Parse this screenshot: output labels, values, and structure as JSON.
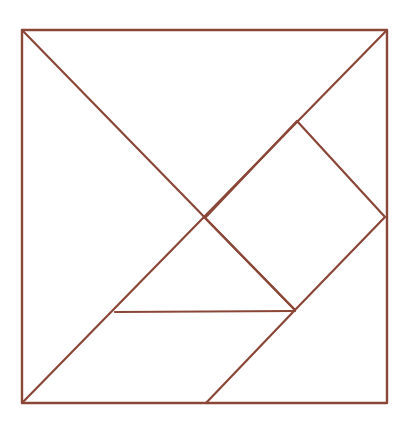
{
  "figure": {
    "title": "Tangram dissection of a square",
    "kind": "line-diagram",
    "canvas": {
      "width": 409,
      "height": 426
    },
    "background_color": "#ffffff",
    "stroke_color": "#8a4738",
    "stroke_width": 2.2,
    "outline_stroke_width": 2.4,
    "square": {
      "label": "outer square",
      "left": 22,
      "top": 30,
      "right": 387,
      "bottom": 403,
      "width": 365,
      "height": 373
    },
    "vertices": {
      "top_left": "22,30",
      "top_right": "387,30",
      "bottom_right": "387,403",
      "bottom_left": "22,403",
      "center_cross": "205,218",
      "diamond_top": "297,121",
      "diamond_right": "385,217",
      "diamond_bottom": "295,310",
      "left_mid_lower": "115,312",
      "bottom_mid": "206,403"
    },
    "paths": {
      "outline": "M22,30 L387,30 L387,403 L22,403 Z",
      "main_diagonal": "M22,30 L295,310",
      "anti_diagonal": "M387,30 L22,403",
      "diamond": "M297,121 L385,217 L295,310 L205,218 Z",
      "horizontal_chord": "M115,312 L295,311",
      "lower_right_cut": "M295,310 L206,403"
    },
    "pieces": [
      {
        "name": "large-triangle-upper-left",
        "points": "22,30 205,218 22,403"
      },
      {
        "name": "large-triangle-upper-right",
        "points": "22,30 387,30 205,218"
      },
      {
        "name": "medium-triangle-right",
        "points": "297,121 385,217 205,218"
      },
      {
        "name": "small-triangle-center",
        "points": "205,218 295,310 115,312"
      },
      {
        "name": "small-triangle-lower-right",
        "points": "295,310 387,403 206,403"
      },
      {
        "name": "square-piece",
        "points": "205,218 297,121 385,217 295,310"
      },
      {
        "name": "parallelogram-lower-left",
        "points": "115,312 295,311 206,403 22,403"
      }
    ],
    "piece_count": 7
  }
}
